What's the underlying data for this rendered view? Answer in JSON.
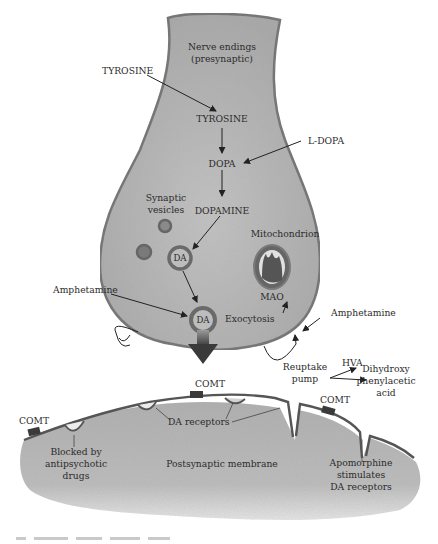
{
  "diagram": {
    "title_region": "Dopaminergic synapse",
    "colors": {
      "presynaptic_fill": "#b9b9b9",
      "presynaptic_edge": "#6e6e6e",
      "postsynaptic_fill": "#b5b5b5",
      "membrane_line": "#555555",
      "vesicle_ring": "#6a6a6a",
      "arrow": "#222222",
      "comt_block": "#3a3a3a"
    },
    "presynaptic": {
      "header_line1": "Nerve endings",
      "header_line2": "(presynaptic)",
      "tyrosine_internal": "TYROSINE",
      "dopa": "DOPA",
      "dopamine": "DOPAMINE",
      "synaptic_vesicles_line1": "Synaptic",
      "synaptic_vesicles_line2": "vesicles",
      "vesicle_da": "DA",
      "exocytosis_da": "DA",
      "mitochondrion": "Mitochondrion",
      "mao": "MAO",
      "exocytosis": "Exocytosis"
    },
    "external": {
      "tyrosine": "TYROSINE",
      "l_dopa": "L-DOPA",
      "amphetamine_left": "Amphetamine",
      "amphetamine_right": "Amphetamine",
      "reuptake_line1": "Reuptake",
      "reuptake_line2": "pump",
      "hva": "HVA",
      "dihydroxy_line1": "Dihydroxy",
      "dihydroxy_line2": "phenylacetic",
      "dihydroxy_line3": "acid"
    },
    "postsynaptic": {
      "comt_left": "COMT",
      "comt_center": "COMT",
      "comt_right": "COMT",
      "da_receptors": "DA receptors",
      "blocked_line1": "Blocked by",
      "blocked_line2": "antipsychotic",
      "blocked_line3": "drugs",
      "membrane": "Postsynaptic membrane",
      "apomorphine_line1": "Apomorphine",
      "apomorphine_line2": "stimulates",
      "apomorphine_line3": "DA receptors"
    }
  }
}
